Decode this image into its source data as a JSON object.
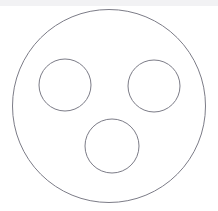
{
  "canvas": {
    "width": 218,
    "height": 211,
    "background_color": "#ffffff",
    "top_band_color": "#f2f2f4",
    "top_band_height": 6
  },
  "figure": {
    "stroke_color": "#7c7c87",
    "fill_color": "#ffffff",
    "stroke_width": 1,
    "shapes": [
      {
        "name": "outer-circle",
        "role": "container",
        "cx": 109,
        "cy": 106,
        "r": 96.5,
        "stroke": "#7c7c87",
        "fill": "#ffffff",
        "stroke_width": 1
      },
      {
        "name": "upper-left-circle",
        "role": "inner",
        "cx": 65,
        "cy": 85,
        "r": 26,
        "stroke": "#7c7c87",
        "fill": "#ffffff",
        "stroke_width": 1
      },
      {
        "name": "upper-right-circle",
        "role": "inner",
        "cx": 154,
        "cy": 86,
        "r": 26,
        "stroke": "#7c7c87",
        "fill": "#ffffff",
        "stroke_width": 1
      },
      {
        "name": "lower-center-circle",
        "role": "inner",
        "cx": 112,
        "cy": 146,
        "r": 27,
        "stroke": "#7c7c87",
        "fill": "#ffffff",
        "stroke_width": 1
      }
    ]
  }
}
